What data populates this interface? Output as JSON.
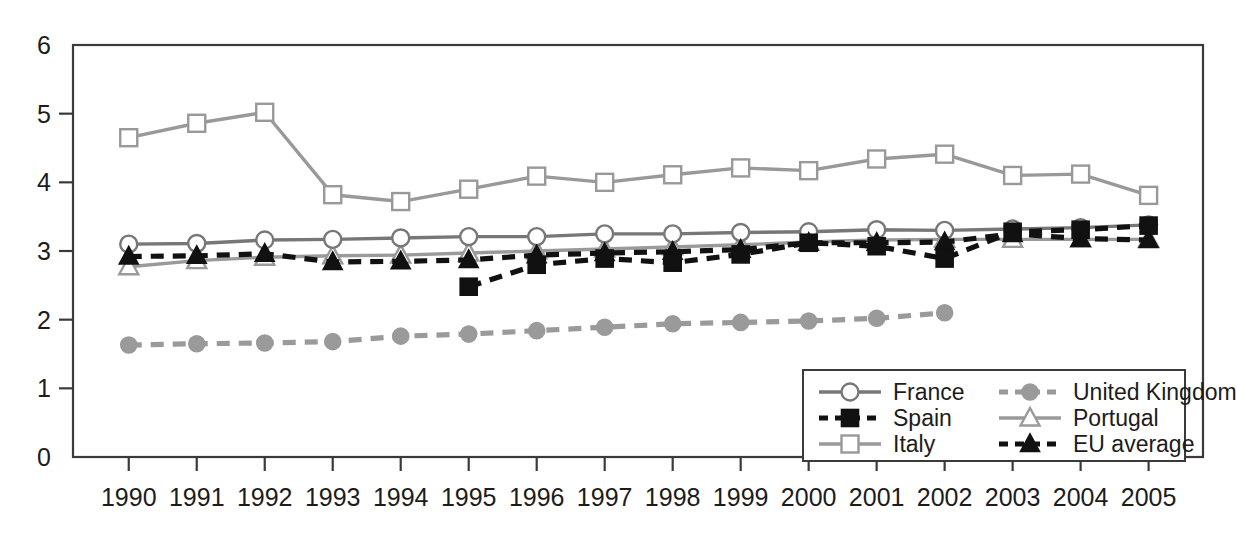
{
  "chart_data": {
    "type": "line",
    "title": "",
    "subtitle": "",
    "xlabel": "",
    "ylabel": "",
    "grid": false,
    "legend_position": "inside-bottom-right",
    "x": [
      1990,
      1991,
      1992,
      1993,
      1994,
      1995,
      1996,
      1997,
      1998,
      1999,
      2000,
      2001,
      2002,
      2003,
      2004,
      2005
    ],
    "categories": [
      "1990",
      "1991",
      "1992",
      "1993",
      "1994",
      "1995",
      "1996",
      "1997",
      "1998",
      "1999",
      "2000",
      "2001",
      "2002",
      "2003",
      "2004",
      "2005"
    ],
    "xlim": [
      1989.5,
      2005.5
    ],
    "ylim": [
      0,
      6
    ],
    "ytick_labels": [
      "0",
      "1",
      "2",
      "3",
      "4",
      "5",
      "6"
    ],
    "ytick_values": [
      0,
      1,
      2,
      3,
      4,
      5,
      6
    ],
    "series": [
      {
        "name": "France",
        "color": "#777777",
        "marker": "circle-open",
        "dash": "solid",
        "values": [
          3.1,
          3.11,
          3.16,
          3.17,
          3.19,
          3.21,
          3.21,
          3.25,
          3.25,
          3.27,
          3.28,
          3.31,
          3.3,
          3.32,
          3.34,
          3.38
        ]
      },
      {
        "name": "Spain",
        "color": "#111111",
        "marker": "square-filled",
        "dash": "dashed",
        "values": [
          null,
          null,
          null,
          null,
          null,
          2.48,
          2.8,
          2.89,
          2.83,
          2.95,
          3.12,
          3.07,
          2.89,
          3.28,
          3.31,
          3.37
        ]
      },
      {
        "name": "Italy",
        "color": "#999999",
        "marker": "square-open",
        "dash": "solid",
        "values": [
          4.65,
          4.86,
          5.02,
          3.82,
          3.72,
          3.9,
          4.09,
          4.0,
          4.11,
          4.21,
          4.17,
          4.34,
          4.41,
          4.1,
          4.12,
          3.81
        ]
      },
      {
        "name": "United Kingdom",
        "color": "#9a9a9a",
        "marker": "circle-filled",
        "dash": "dashed",
        "values": [
          1.63,
          1.65,
          1.66,
          1.68,
          1.76,
          1.79,
          1.84,
          1.89,
          1.94,
          1.96,
          1.98,
          2.02,
          2.1,
          null,
          null,
          null
        ]
      },
      {
        "name": "Portugal",
        "color": "#9a9a9a",
        "marker": "triangle-open",
        "dash": "solid",
        "values": [
          2.77,
          2.86,
          2.91,
          2.93,
          2.94,
          2.97,
          3.0,
          3.03,
          3.06,
          3.09,
          3.13,
          3.16,
          3.17,
          3.17,
          3.17,
          3.17
        ]
      },
      {
        "name": "EU average",
        "color": "#111111",
        "marker": "triangle-filled",
        "dash": "dashed",
        "values": [
          2.92,
          2.93,
          2.96,
          2.84,
          2.85,
          2.87,
          2.94,
          2.97,
          2.99,
          3.02,
          3.12,
          3.12,
          3.13,
          3.25,
          3.18,
          3.16
        ]
      }
    ]
  },
  "legend": {
    "entries": [
      {
        "label": "France",
        "key": "france"
      },
      {
        "label": "United Kingdom",
        "key": "united-kingdom"
      },
      {
        "label": "Spain",
        "key": "spain"
      },
      {
        "label": "Portugal",
        "key": "portugal"
      },
      {
        "label": "Italy",
        "key": "italy"
      },
      {
        "label": "EU average",
        "key": "eu-average"
      }
    ]
  },
  "axes": {
    "y_labels": [
      "6",
      "5",
      "4",
      "3",
      "2",
      "1",
      "0"
    ],
    "x_labels": [
      "1990",
      "1991",
      "1992",
      "1993",
      "1994",
      "1995",
      "1996",
      "1997",
      "1998",
      "1999",
      "2000",
      "2001",
      "2002",
      "2003",
      "2004",
      "2005"
    ]
  },
  "colors": {
    "axis": "#3a3a3a",
    "text": "#1c1c1c",
    "gray_line": "#999999",
    "dark_line": "#777777",
    "black_line": "#111111",
    "background": "#ffffff"
  }
}
